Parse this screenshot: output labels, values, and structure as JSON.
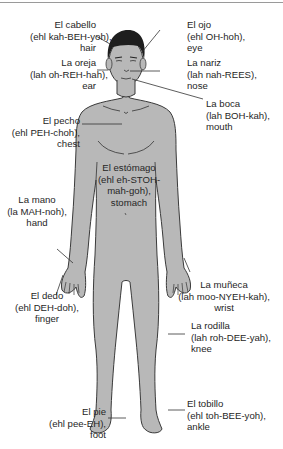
{
  "diagram": {
    "colors": {
      "body_fill": "#b8b8b8",
      "outline": "#3a3a3a",
      "hair": "#1e1e1e",
      "text": "#262626",
      "leader": "#333333"
    },
    "labels": [
      {
        "id": "hair",
        "spanish": "El cabello",
        "pronunciation": "(ehl kah-BEH-yoh),",
        "english": "hair"
      },
      {
        "id": "ear",
        "spanish": "La oreja",
        "pronunciation": "(lah oh-REH-hah),",
        "english": "ear"
      },
      {
        "id": "eye",
        "spanish": "El ojo",
        "pronunciation": "(ehl OH-hoh),",
        "english": "eye"
      },
      {
        "id": "nose",
        "spanish": "La nariz",
        "pronunciation": "(lah nah-REES),",
        "english": "nose"
      },
      {
        "id": "mouth",
        "spanish": "La boca",
        "pronunciation": "(lah BOH-kah),",
        "english": "mouth"
      },
      {
        "id": "chest",
        "spanish": "El pecho",
        "pronunciation": "(ehl PEH-choh),",
        "english": "chest"
      },
      {
        "id": "stomach",
        "spanish": "El estómago",
        "pronunciation_1": "(ehl eh-STOH-",
        "pronunciation_2": "mah-goh),",
        "english": "stomach"
      },
      {
        "id": "hand",
        "spanish": "La mano",
        "pronunciation": "(la MAH-noh),",
        "english": "hand"
      },
      {
        "id": "finger",
        "spanish": "El dedo",
        "pronunciation": "(ehl DEH-doh),",
        "english": "finger"
      },
      {
        "id": "wrist",
        "spanish": "La muñeca",
        "pronunciation": "(lah moo-NYEH-kah),",
        "english": "wrist"
      },
      {
        "id": "knee",
        "spanish": "La rodilla",
        "pronunciation": "(lah roh-DEE-yah),",
        "english": "knee"
      },
      {
        "id": "foot",
        "spanish": "El pie",
        "pronunciation": "(ehl pee-EH),",
        "english": "foot"
      },
      {
        "id": "ankle",
        "spanish": "El tobillo",
        "pronunciation": "(ehl toh-BEE-yoh),",
        "english": "ankle"
      }
    ]
  }
}
